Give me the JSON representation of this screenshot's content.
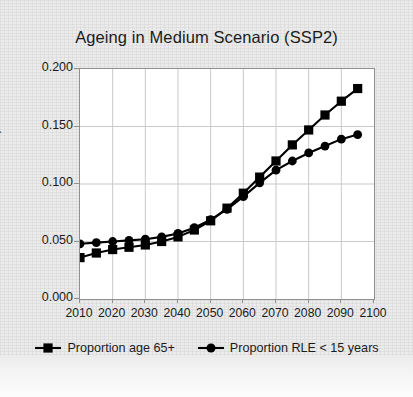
{
  "chart_data": {
    "type": "line",
    "title": "Ageing in Medium Scenario (SSP2)",
    "xlabel": "",
    "ylabel": "Proportion",
    "xlim": [
      2010,
      2100
    ],
    "ylim": [
      0.0,
      0.2
    ],
    "xticks": [
      "2010",
      "2020",
      "2030",
      "2040",
      "2050",
      "2060",
      "2070",
      "2080",
      "2090",
      "2100"
    ],
    "yticks": [
      "0.000",
      "0.050",
      "0.100",
      "0.150",
      "0.200"
    ],
    "grid": true,
    "legend_position": "bottom",
    "x": [
      2010,
      2015,
      2020,
      2025,
      2030,
      2035,
      2040,
      2045,
      2050,
      2055,
      2060,
      2065,
      2070,
      2075,
      2080,
      2085,
      2090,
      2095
    ],
    "series": [
      {
        "name": "Proportion age 65+",
        "marker": "square",
        "color": "#000000",
        "values": [
          0.036,
          0.04,
          0.043,
          0.045,
          0.047,
          0.05,
          0.054,
          0.06,
          0.068,
          0.079,
          0.092,
          0.106,
          0.12,
          0.134,
          0.147,
          0.16,
          0.172,
          0.183
        ]
      },
      {
        "name": "Proportion RLE < 15 years",
        "marker": "circle",
        "color": "#000000",
        "values": [
          0.048,
          0.049,
          0.05,
          0.051,
          0.052,
          0.054,
          0.057,
          0.062,
          0.069,
          0.078,
          0.089,
          0.101,
          0.112,
          0.12,
          0.127,
          0.133,
          0.139,
          0.143
        ]
      }
    ]
  },
  "legend": {
    "entries": [
      {
        "label": "Proportion age 65+",
        "marker": "square"
      },
      {
        "label": "Proportion RLE < 15 years",
        "marker": "circle"
      }
    ]
  }
}
